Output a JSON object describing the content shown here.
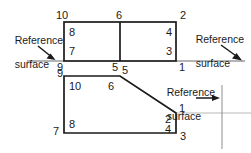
{
  "figure": {
    "stroke_color": "#1a1a1a",
    "reference_line_color": "#5a5a5a",
    "gridline_color": "#b3b3b3",
    "background": "#ffffff"
  },
  "annotations": {
    "left": {
      "line1": "Reference",
      "line2": "surface",
      "arrow": "arrow-down-right"
    },
    "top_right": {
      "line1": "Reference",
      "line2": "surface",
      "arrow": "arrow-down-right"
    },
    "bottom_right": {
      "line1": "Reference",
      "line2": "surface",
      "arrow": "arrow-right"
    }
  },
  "top_figure": {
    "name": "top-rectangle",
    "shape": "rectangle-with-divider",
    "outline": [
      [
        64,
        22
      ],
      [
        176,
        22
      ],
      [
        176,
        61
      ],
      [
        64,
        61
      ]
    ],
    "divider": [
      [
        120,
        22
      ],
      [
        120,
        61
      ]
    ],
    "labels": [
      {
        "id": "top-10",
        "text": "10",
        "x": 56,
        "y": 10,
        "position": "outside-top-left"
      },
      {
        "id": "top-6",
        "text": "6",
        "x": 116,
        "y": 10,
        "position": "outside-top-center"
      },
      {
        "id": "top-2",
        "text": "2",
        "x": 180,
        "y": 10,
        "position": "outside-top-right"
      },
      {
        "id": "top-8",
        "text": "8",
        "x": 69,
        "y": 27,
        "position": "inside-top-left"
      },
      {
        "id": "top-4",
        "text": "4",
        "x": 166,
        "y": 27,
        "position": "inside-top-right"
      },
      {
        "id": "top-7",
        "text": "7",
        "x": 69,
        "y": 46,
        "position": "inside-bottom-left"
      },
      {
        "id": "top-3",
        "text": "3",
        "x": 166,
        "y": 46,
        "position": "inside-bottom-right"
      },
      {
        "id": "top-9",
        "text": "9",
        "x": 56,
        "y": 62,
        "position": "outside-bottom-left"
      },
      {
        "id": "top-5",
        "text": "5",
        "x": 112,
        "y": 62,
        "position": "outside-bottom-center"
      },
      {
        "id": "top-1",
        "text": "1",
        "x": 179,
        "y": 62,
        "position": "outside-bottom-right"
      }
    ]
  },
  "bottom_figure": {
    "name": "bottom-polygon",
    "shape": "chamfered-polygon",
    "outline": [
      [
        64,
        76
      ],
      [
        120,
        76
      ],
      [
        176,
        113
      ],
      [
        176,
        133
      ],
      [
        64,
        133
      ]
    ],
    "labels": [
      {
        "id": "bot-9",
        "text": "9",
        "x": 56,
        "y": 69,
        "position": "outside-top-left"
      },
      {
        "id": "bot-5",
        "text": "5",
        "x": 122,
        "y": 66,
        "position": "outside-top-vertex"
      },
      {
        "id": "bot-10",
        "text": "10",
        "x": 69,
        "y": 81,
        "position": "inside-top-left"
      },
      {
        "id": "bot-6",
        "text": "6",
        "x": 109,
        "y": 81,
        "position": "inside-top-center"
      },
      {
        "id": "bot-1",
        "text": "1",
        "x": 179,
        "y": 104,
        "position": "outside-right-vertex"
      },
      {
        "id": "bot-2",
        "text": "2",
        "x": 166,
        "y": 114,
        "position": "inside-right-upper"
      },
      {
        "id": "bot-4",
        "text": "4",
        "x": 166,
        "y": 124,
        "position": "inside-right-lower"
      },
      {
        "id": "bot-3",
        "text": "3",
        "x": 180,
        "y": 134,
        "position": "outside-bottom-right"
      },
      {
        "id": "bot-8",
        "text": "8",
        "x": 69,
        "y": 119,
        "position": "inside-bottom-left"
      },
      {
        "id": "bot-7",
        "text": "7",
        "x": 54,
        "y": 125,
        "position": "outside-bottom-left"
      }
    ]
  },
  "reference_lines": {
    "left_horizontal": {
      "x1": 27,
      "y1": 61,
      "x2": 64,
      "y2": 61
    },
    "right_horizontal": {
      "x1": 176,
      "y1": 61,
      "x2": 245,
      "y2": 61
    },
    "bottom_horizontal": {
      "x1": 176,
      "y1": 113,
      "x2": 251,
      "y2": 113
    },
    "bottom_vertical": {
      "x1": 222,
      "y1": 85,
      "x2": 222,
      "y2": 148
    }
  }
}
